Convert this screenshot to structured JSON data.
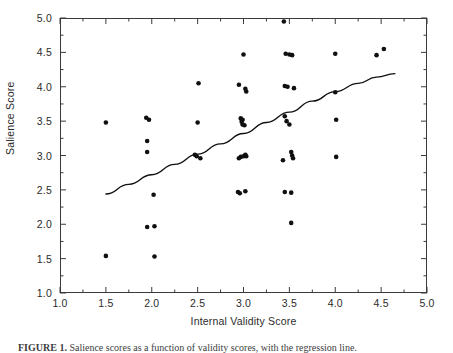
{
  "figure": {
    "caption_label": "FIGURE 1.",
    "caption_text": "Salience scores as a function of validity scores, with the regression line."
  },
  "axes": {
    "x_title": "Internal Validity Score",
    "y_title": "Salience Score",
    "x_ticks": [
      "1.0",
      "1.5",
      "2.0",
      "2.5",
      "3.0",
      "3.5",
      "4.0",
      "4.5",
      "5.0"
    ],
    "y_ticks": [
      "1.0",
      "1.5",
      "2.0",
      "2.5",
      "3.0",
      "3.5",
      "4.0",
      "4.5",
      "5.0"
    ]
  },
  "colors": {
    "point": "#101010",
    "line": "#101010",
    "frame": "#3a3a3a",
    "text": "#2b2b2b",
    "background": "#ffffff"
  },
  "chart_data": {
    "type": "scatter",
    "title": "",
    "xlabel": "Internal Validity Score",
    "ylabel": "Salience Score",
    "xlim": [
      1.0,
      5.0
    ],
    "ylim": [
      1.0,
      5.0
    ],
    "xticks": [
      1.0,
      1.5,
      2.0,
      2.5,
      3.0,
      3.5,
      4.0,
      4.5,
      5.0
    ],
    "yticks": [
      1.0,
      1.5,
      2.0,
      2.5,
      3.0,
      3.5,
      4.0,
      4.5,
      5.0
    ],
    "minor_ticks": true,
    "grid": false,
    "legend": null,
    "marker": "filled-circle",
    "marker_size_px": 3.2,
    "points": [
      [
        1.5,
        3.48
      ],
      [
        1.5,
        1.54
      ],
      [
        1.94,
        3.55
      ],
      [
        1.97,
        3.52
      ],
      [
        1.95,
        3.21
      ],
      [
        1.95,
        3.05
      ],
      [
        2.02,
        2.43
      ],
      [
        1.95,
        1.96
      ],
      [
        2.03,
        1.97
      ],
      [
        2.03,
        1.53
      ],
      [
        2.51,
        4.05
      ],
      [
        2.5,
        3.48
      ],
      [
        2.47,
        3.01
      ],
      [
        2.49,
        2.99
      ],
      [
        2.53,
        2.96
      ],
      [
        2.95,
        4.03
      ],
      [
        3.02,
        3.97
      ],
      [
        3.03,
        3.93
      ],
      [
        3.0,
        4.47
      ],
      [
        2.97,
        3.54
      ],
      [
        2.99,
        3.52
      ],
      [
        2.98,
        3.49
      ],
      [
        2.99,
        3.45
      ],
      [
        3.01,
        3.44
      ],
      [
        3.02,
        3.01
      ],
      [
        3.03,
        2.99
      ],
      [
        2.97,
        2.98
      ],
      [
        2.95,
        2.96
      ],
      [
        3.0,
        2.99
      ],
      [
        2.94,
        2.47
      ],
      [
        2.96,
        2.45
      ],
      [
        3.02,
        2.48
      ],
      [
        3.44,
        4.95
      ],
      [
        3.46,
        4.48
      ],
      [
        3.5,
        4.47
      ],
      [
        3.53,
        4.46
      ],
      [
        3.45,
        4.01
      ],
      [
        3.48,
        4.0
      ],
      [
        3.55,
        3.98
      ],
      [
        3.45,
        3.57
      ],
      [
        3.47,
        3.5
      ],
      [
        3.5,
        3.45
      ],
      [
        3.43,
        2.93
      ],
      [
        3.52,
        3.05
      ],
      [
        3.53,
        3.0
      ],
      [
        3.54,
        2.96
      ],
      [
        3.45,
        2.47
      ],
      [
        3.52,
        2.46
      ],
      [
        3.52,
        2.02
      ],
      [
        4.0,
        4.48
      ],
      [
        4.0,
        3.92
      ],
      [
        4.01,
        3.52
      ],
      [
        4.01,
        2.98
      ],
      [
        4.45,
        4.46
      ],
      [
        4.53,
        4.55
      ]
    ],
    "fit_line": {
      "label": "regression line",
      "style": "solid",
      "points": [
        [
          1.5,
          2.44
        ],
        [
          1.75,
          2.58
        ],
        [
          2.0,
          2.72
        ],
        [
          2.25,
          2.87
        ],
        [
          2.5,
          3.02
        ],
        [
          2.75,
          3.17
        ],
        [
          3.0,
          3.32
        ],
        [
          3.25,
          3.48
        ],
        [
          3.5,
          3.63
        ],
        [
          3.75,
          3.79
        ],
        [
          4.0,
          3.93
        ],
        [
          4.25,
          4.05
        ],
        [
          4.45,
          4.14
        ],
        [
          4.65,
          4.19
        ]
      ]
    }
  }
}
